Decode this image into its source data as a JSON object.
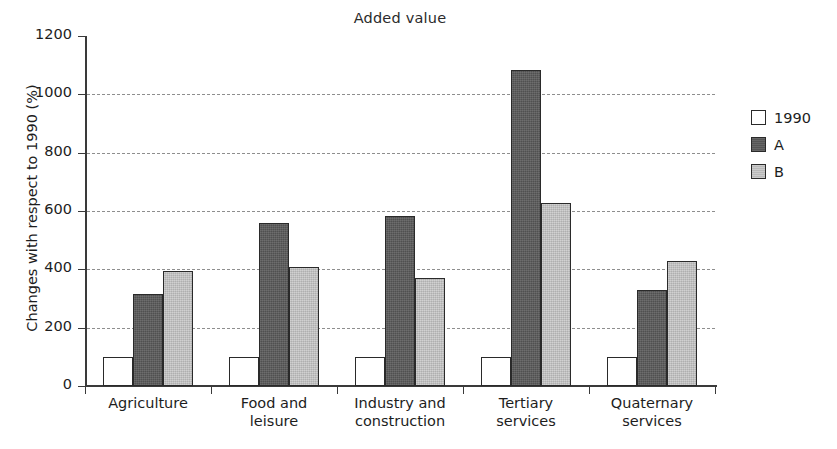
{
  "chart_data": {
    "type": "bar",
    "title": "Added value",
    "xlabel": "",
    "ylabel": "Changes with respect to 1990 (%)",
    "ylim": [
      0,
      1200
    ],
    "ytick_labels": [
      "0",
      "200",
      "400",
      "600",
      "800",
      "1000",
      "1200"
    ],
    "yticks": [
      0,
      200,
      400,
      600,
      800,
      1000,
      1200
    ],
    "grid": "horizontal-dashed",
    "legend_position": "right",
    "categories": [
      "Agriculture",
      "Food and leisure",
      "Industry and construction",
      "Tertiary services",
      "Quaternary services"
    ],
    "category_lines": [
      [
        "Agriculture"
      ],
      [
        "Food and",
        "leisure"
      ],
      [
        "Industry and",
        "construction"
      ],
      [
        "Tertiary",
        "services"
      ],
      [
        "Quaternary",
        "services"
      ]
    ],
    "series": [
      {
        "name": "1990",
        "color": "#ffffff",
        "values": [
          100,
          100,
          100,
          100,
          100
        ]
      },
      {
        "name": "A",
        "color": "#595959",
        "values": [
          317,
          558,
          583,
          1085,
          330
        ]
      },
      {
        "name": "B",
        "color": "#c2c2c2",
        "values": [
          393,
          408,
          372,
          628,
          428
        ]
      }
    ]
  },
  "legend": {
    "entries": [
      {
        "label": "1990",
        "swatch": "series-1990"
      },
      {
        "label": "A",
        "swatch": "series-A"
      },
      {
        "label": "B",
        "swatch": "series-B"
      }
    ]
  }
}
